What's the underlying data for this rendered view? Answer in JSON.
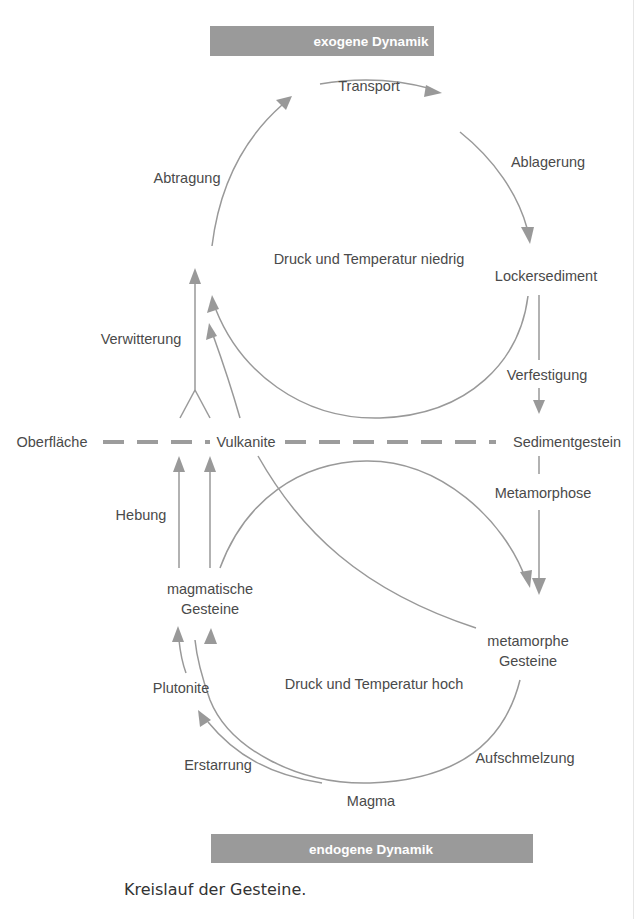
{
  "diagram": {
    "title_top": "exogene Dynamik",
    "title_bottom": "endogene Dynamik",
    "caption": "Kreislauf der Gesteine.",
    "colors": {
      "band": "#9a9a9a",
      "line": "#999999",
      "text": "#4a4a4a",
      "dashed_surface": "#9c9c9c"
    },
    "upper_cycle": {
      "center_label": "Druck und Temperatur niedrig",
      "labels": {
        "transport": "Transport",
        "abtragung": "Abtragung",
        "ablagerung": "Ablagerung",
        "lockersediment": "Lockersediment",
        "verfestigung": "Verfestigung",
        "verwitterung": "Verwitterung"
      }
    },
    "surface_line": {
      "left_label": "Oberfläche",
      "middle_label": "Vulkanite",
      "right_label": "Sedimentgestein"
    },
    "lower_cycle": {
      "center_label": "Druck und Temperatur hoch",
      "labels": {
        "metamorphose": "Metamorphose",
        "hebung": "Hebung",
        "magmatische_line1": "magmatische",
        "magmatische_line2": "Gesteine",
        "metamorphe_line1": "metamorphe",
        "metamorphe_line2": "Gesteine",
        "plutonite": "Plutonite",
        "erstarrung": "Erstarrung",
        "aufschmelzung": "Aufschmelzung",
        "magma": "Magma"
      }
    },
    "nodes": [
      "Lockersediment",
      "Sedimentgestein",
      "metamorphe Gesteine",
      "Magma",
      "Plutonite",
      "Vulkanite",
      "magmatische Gesteine"
    ],
    "edges": [
      {
        "from": "Abtragung",
        "to": "Transport",
        "label": "Transport"
      },
      {
        "from": "Transport",
        "to": "Lockersediment",
        "label": "Ablagerung"
      },
      {
        "from": "Lockersediment",
        "to": "Sedimentgestein",
        "label": "Verfestigung"
      },
      {
        "from": "Sedimentgestein",
        "to": "metamorphe Gesteine",
        "label": "Metamorphose"
      },
      {
        "from": "metamorphe Gesteine",
        "to": "Magma",
        "label": "Aufschmelzung"
      },
      {
        "from": "Magma",
        "to": "Plutonite",
        "label": "Erstarrung"
      },
      {
        "from": "Magma",
        "to": "magmatische Gesteine",
        "label": ""
      },
      {
        "from": "Plutonite",
        "to": "magmatische Gesteine",
        "label": ""
      },
      {
        "from": "magmatische Gesteine",
        "to": "Oberfläche",
        "label": "Hebung"
      },
      {
        "from": "Oberfläche",
        "to": "Abtragung",
        "label": "Verwitterung"
      },
      {
        "from": "magmatische Gesteine",
        "to": "metamorphe Gesteine",
        "label": ""
      },
      {
        "from": "Vulkanite",
        "to": "metamorphe Gesteine",
        "label": ""
      }
    ]
  }
}
